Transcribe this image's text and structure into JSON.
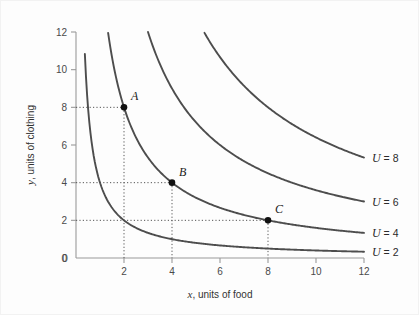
{
  "figure": {
    "background_color": "#fdfdfd",
    "border_color": "#f2f2f2",
    "curve_color": "#4d4d4d",
    "axis_color": "#9a9a9a",
    "point_color": "#111111"
  },
  "chart_data": {
    "type": "line",
    "title": "",
    "subtitle": "",
    "xlabel": "x, units of food",
    "xlabel_var": "x",
    "xlabel_rest": ", units of food",
    "ylabel": "y, units of clothing",
    "ylabel_var": "y",
    "ylabel_rest": ", units of clothing",
    "xlim": [
      0,
      12
    ],
    "ylim": [
      0,
      12
    ],
    "xticks": [
      0,
      2,
      4,
      6,
      8,
      10,
      12
    ],
    "yticks": [
      0,
      2,
      4,
      6,
      8,
      10,
      12
    ],
    "xtick_labels": [
      "0",
      "2",
      "4",
      "6",
      "8",
      "10",
      "12"
    ],
    "ytick_labels": [
      "0",
      "2",
      "4",
      "6",
      "8",
      "10",
      "12"
    ],
    "grid": false,
    "legend_position": "right-inline",
    "curve_family": "utility = sqrt(x*y), indifference curves x*y = U^2",
    "series": [
      {
        "name": "U = 2",
        "label_var": "U",
        "label_rest": " = 2",
        "utility": 2,
        "xy_product": 4,
        "points": [
          {
            "x": 0.33,
            "y": 12
          },
          {
            "x": 0.5,
            "y": 8
          },
          {
            "x": 0.67,
            "y": 6
          },
          {
            "x": 1,
            "y": 4
          },
          {
            "x": 1.33,
            "y": 3
          },
          {
            "x": 2,
            "y": 2
          },
          {
            "x": 2.67,
            "y": 1.5
          },
          {
            "x": 4,
            "y": 1
          },
          {
            "x": 6,
            "y": 0.67
          },
          {
            "x": 8,
            "y": 0.5
          },
          {
            "x": 10,
            "y": 0.4
          },
          {
            "x": 12,
            "y": 0.33
          }
        ]
      },
      {
        "name": "U = 4",
        "label_var": "U",
        "label_rest": " = 4",
        "utility": 4,
        "xy_product": 16,
        "points": [
          {
            "x": 1.33,
            "y": 12
          },
          {
            "x": 1.6,
            "y": 10
          },
          {
            "x": 2,
            "y": 8
          },
          {
            "x": 2.67,
            "y": 6
          },
          {
            "x": 3.2,
            "y": 5
          },
          {
            "x": 4,
            "y": 4
          },
          {
            "x": 5.33,
            "y": 3
          },
          {
            "x": 8,
            "y": 2
          },
          {
            "x": 10.67,
            "y": 1.5
          },
          {
            "x": 12,
            "y": 1.33
          }
        ]
      },
      {
        "name": "U = 6",
        "label_var": "U",
        "label_rest": " = 6",
        "utility": 6,
        "xy_product": 36,
        "points": [
          {
            "x": 3,
            "y": 12
          },
          {
            "x": 3.6,
            "y": 10
          },
          {
            "x": 4.5,
            "y": 8
          },
          {
            "x": 6,
            "y": 6
          },
          {
            "x": 7.2,
            "y": 5
          },
          {
            "x": 9,
            "y": 4
          },
          {
            "x": 12,
            "y": 3
          }
        ]
      },
      {
        "name": "U = 8",
        "label_var": "U",
        "label_rest": " = 8",
        "utility": 8,
        "xy_product": 64,
        "points": [
          {
            "x": 5.33,
            "y": 12
          },
          {
            "x": 6.4,
            "y": 10
          },
          {
            "x": 8,
            "y": 8
          },
          {
            "x": 9.14,
            "y": 7
          },
          {
            "x": 10.67,
            "y": 6
          },
          {
            "x": 12,
            "y": 5.33
          }
        ]
      }
    ],
    "annotations": [
      {
        "label": "A",
        "x": 2,
        "y": 8,
        "on_curve": "U = 4"
      },
      {
        "label": "B",
        "x": 4,
        "y": 4,
        "on_curve": "U = 4"
      },
      {
        "label": "C",
        "x": 8,
        "y": 2,
        "on_curve": "U = 4"
      }
    ],
    "guide_lines": [
      {
        "from_point": "A",
        "type": "horizontal-and-vertical-dotted"
      },
      {
        "from_point": "B",
        "type": "horizontal-and-vertical-dotted"
      },
      {
        "from_point": "C",
        "type": "horizontal-and-vertical-dotted"
      }
    ]
  }
}
